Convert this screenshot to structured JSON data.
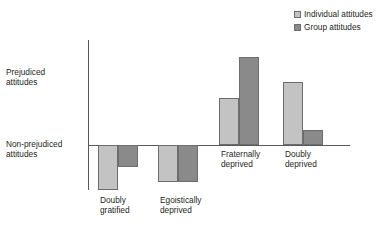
{
  "legend": {
    "position": "top-right",
    "entries": [
      {
        "label": "Individual attitudes",
        "color": "#c3c3c3",
        "key": "individual"
      },
      {
        "label": "Group attitudes",
        "color": "#8a8a8a",
        "key": "group"
      }
    ]
  },
  "axis": {
    "y_top_label_line1": "Prejudiced",
    "y_top_label_line2": "attitudes",
    "y_bottom_label_line1": "Non-prejudiced",
    "y_bottom_label_line2": "attitudes"
  },
  "categories": [
    {
      "line1": "Doubly",
      "line2": "gratified"
    },
    {
      "line1": "Egoistically",
      "line2": "deprived"
    },
    {
      "line1": "Fraternally",
      "line2": "deprived"
    },
    {
      "line1": "Doubly",
      "line2": "deprived"
    }
  ],
  "chart_data": {
    "type": "bar",
    "title": "",
    "xlabel": "",
    "ylabel": "",
    "grid": false,
    "legend_position": "top-right",
    "categories": [
      "Doubly gratified",
      "Egoistically deprived",
      "Fraternally deprived",
      "Doubly deprived"
    ],
    "series": [
      {
        "name": "Individual attitudes",
        "color": "#c3c3c3",
        "values": [
          -45,
          -37,
          47,
          63
        ]
      },
      {
        "name": "Group attitudes",
        "color": "#8a8a8a",
        "values": [
          -22,
          -37,
          88,
          15
        ]
      }
    ],
    "ylim": [
      -50,
      105
    ],
    "y_axis_annotations": [
      {
        "position": "upper",
        "text": "Prejudiced attitudes"
      },
      {
        "position": "zero",
        "text": "Non-prejudiced attitudes"
      }
    ]
  }
}
